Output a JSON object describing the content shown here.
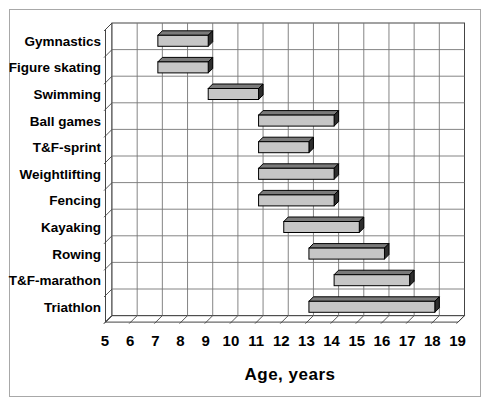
{
  "window": {
    "background": "#ffffff",
    "frame_border": "#a8a8a8"
  },
  "chart_data": {
    "type": "bar",
    "subtype": "horizontal-floating-range-3d",
    "title": "",
    "xlabel": "Age, years",
    "ylabel": "",
    "categories": [
      "Gymnastics",
      "Figure skating",
      "Swimming",
      "Ball games",
      "T&F-sprint",
      "Weightlifting",
      "Fencing",
      "Kayaking",
      "Rowing",
      "T&F-marathon",
      "Triathlon"
    ],
    "series": [
      {
        "name": "Recommended age range to begin the sport, years",
        "ranges": [
          {
            "category": "Gymnastics",
            "start": 7,
            "end": 9
          },
          {
            "category": "Figure skating",
            "start": 7,
            "end": 9
          },
          {
            "category": "Swimming",
            "start": 9,
            "end": 11
          },
          {
            "category": "Ball games",
            "start": 11,
            "end": 14
          },
          {
            "category": "T&F-sprint",
            "start": 11,
            "end": 13
          },
          {
            "category": "Weightlifting",
            "start": 11,
            "end": 14
          },
          {
            "category": "Fencing",
            "start": 11,
            "end": 14
          },
          {
            "category": "Kayaking",
            "start": 12,
            "end": 15
          },
          {
            "category": "Rowing",
            "start": 13,
            "end": 16
          },
          {
            "category": "T&F-marathon",
            "start": 14,
            "end": 17
          },
          {
            "category": "Triathlon",
            "start": 13,
            "end": 18
          }
        ]
      }
    ],
    "xlim": [
      5,
      19
    ],
    "x_ticks": [
      5,
      6,
      7,
      8,
      9,
      10,
      11,
      12,
      13,
      14,
      15,
      16,
      17,
      18,
      19
    ],
    "grid": true,
    "legend": false,
    "effect": "3d",
    "colors": {
      "bar_face": "#c6c6c6",
      "bar_top": "#7a7a7a",
      "bar_side": "#2e2e2e",
      "bar_outline": "#000000",
      "grid": "#777777",
      "wall_edge": "#444444",
      "text": "#000000",
      "plot_background": "#ffffff"
    }
  }
}
